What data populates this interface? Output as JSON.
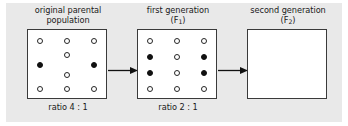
{
  "figure": {
    "type": "genetics-inheritance-diagram",
    "background_color": "#e9e9e9",
    "box_background_color": "#ffffff",
    "box_border_color": "#3a3a3a",
    "open_circle_color": "#ffffff",
    "filled_circle_color": "#111111",
    "text_color": "#1a1a1a"
  },
  "panels": [
    {
      "title_line1": "original parental",
      "title_line2": "population",
      "ratio_label": "ratio 4 : 1",
      "open_count": 8,
      "filled_count": 2,
      "dots": [
        {
          "x": 9,
          "y": 8,
          "type": "open"
        },
        {
          "x": 36,
          "y": 8,
          "type": "open"
        },
        {
          "x": 63,
          "y": 8,
          "type": "open"
        },
        {
          "x": 36,
          "y": 22,
          "type": "open"
        },
        {
          "x": 9,
          "y": 32,
          "type": "filled"
        },
        {
          "x": 63,
          "y": 32,
          "type": "filled"
        },
        {
          "x": 36,
          "y": 42,
          "type": "open"
        },
        {
          "x": 9,
          "y": 56,
          "type": "open"
        },
        {
          "x": 36,
          "y": 56,
          "type": "open"
        },
        {
          "x": 63,
          "y": 56,
          "type": "open"
        }
      ]
    },
    {
      "title_line1": "first generation",
      "title_line2_pre": "(F",
      "title_line2_sub": "1",
      "title_line2_post": ")",
      "ratio_label": "ratio 2 : 1",
      "open_count": 8,
      "filled_count": 4,
      "dots": [
        {
          "x": 9,
          "y": 8,
          "type": "open"
        },
        {
          "x": 36,
          "y": 8,
          "type": "open"
        },
        {
          "x": 63,
          "y": 8,
          "type": "open"
        },
        {
          "x": 9,
          "y": 24,
          "type": "filled"
        },
        {
          "x": 36,
          "y": 24,
          "type": "open"
        },
        {
          "x": 63,
          "y": 24,
          "type": "filled"
        },
        {
          "x": 9,
          "y": 40,
          "type": "filled"
        },
        {
          "x": 36,
          "y": 40,
          "type": "open"
        },
        {
          "x": 63,
          "y": 40,
          "type": "filled"
        },
        {
          "x": 9,
          "y": 56,
          "type": "open"
        },
        {
          "x": 36,
          "y": 56,
          "type": "open"
        },
        {
          "x": 63,
          "y": 56,
          "type": "open"
        }
      ]
    },
    {
      "title_line1": "second generation",
      "title_line2_pre": "(F",
      "title_line2_sub": "2",
      "title_line2_post": ")",
      "ratio_label": "",
      "open_count": 0,
      "filled_count": 0,
      "dots": []
    }
  ],
  "arrows": [
    {
      "name": "arrow-parental-to-f1",
      "direction": "right"
    },
    {
      "name": "arrow-f1-to-f2",
      "direction": "right"
    }
  ]
}
